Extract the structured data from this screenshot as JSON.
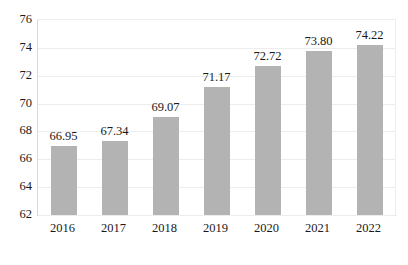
{
  "chart_data": {
    "type": "bar",
    "title": "",
    "subtitle": "",
    "xlabel": "",
    "ylabel": "",
    "categories": [
      "2016",
      "2017",
      "2018",
      "2019",
      "2020",
      "2021",
      "2022"
    ],
    "values": [
      66.95,
      67.34,
      69.07,
      71.17,
      72.72,
      73.8,
      74.22
    ],
    "data_labels": [
      "66.95",
      "67.34",
      "69.07",
      "71.17",
      "72.72",
      "73.80",
      "74.22"
    ],
    "ylim": [
      62,
      76
    ],
    "y_ticks": [
      62,
      64,
      66,
      68,
      70,
      72,
      74,
      76
    ],
    "y_tick_labels": [
      "62",
      "64",
      "66",
      "68",
      "70",
      "72",
      "74",
      "76"
    ],
    "grid": true,
    "legend": false,
    "legend_position": "none",
    "bar_color": "#b3b3b3",
    "gridline_color": "#ededed",
    "axis_color": "#c9c9c9",
    "text_color": "#1a1a1a",
    "background_color": "#ffffff"
  }
}
